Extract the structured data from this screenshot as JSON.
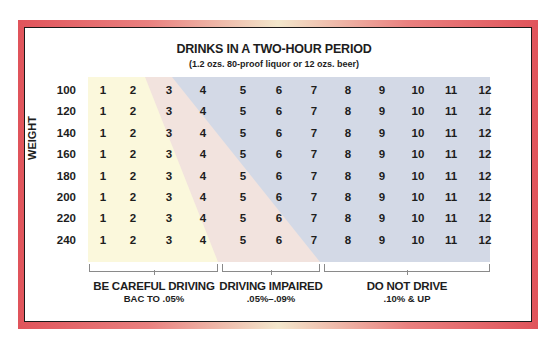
{
  "chart_data": {
    "type": "table",
    "title": "DRINKS IN A TWO-HOUR PERIOD",
    "subtitle": "(1.2 ozs. 80-proof liquor or 12 ozs. beer)",
    "ylabel": "WEIGHT",
    "row_labels": [
      "100",
      "120",
      "140",
      "160",
      "180",
      "200",
      "220",
      "240"
    ],
    "column_values": [
      "1",
      "2",
      "3",
      "4",
      "5",
      "6",
      "7",
      "8",
      "9",
      "10",
      "11",
      "12"
    ],
    "zones": [
      {
        "name": "BE CAREFUL DRIVING",
        "range": "BAC TO .05%",
        "color": "#fbf8dc"
      },
      {
        "name": "DRIVING IMPAIRED",
        "range": ".05%–.09%",
        "color": "#f2e3de"
      },
      {
        "name": "DO NOT DRIVE",
        "range": ".10% & UP",
        "color": "#d3d9e6"
      }
    ],
    "zone_boundaries_by_row": {
      "note": "drinks count where zone changes, top row 100 lbs to bottom row 240 lbs",
      "careful_to_impaired": [
        2.5,
        2.7,
        3.0,
        3.2,
        3.4,
        3.6,
        3.9,
        4.2
      ],
      "impaired_to_do_not_drive": [
        3.2,
        3.8,
        4.3,
        4.9,
        5.5,
        6.0,
        6.5,
        7.0
      ]
    }
  },
  "header": {
    "title": "DRINKS IN A TWO-HOUR PERIOD",
    "subtitle": "(1.2 ozs. 80-proof liquor or 12 ozs. beer)"
  },
  "axis": {
    "weight_label": "WEIGHT"
  },
  "rows": [
    {
      "weight": "100"
    },
    {
      "weight": "120"
    },
    {
      "weight": "140"
    },
    {
      "weight": "160"
    },
    {
      "weight": "180"
    },
    {
      "weight": "200"
    },
    {
      "weight": "220"
    },
    {
      "weight": "240"
    }
  ],
  "columns": [
    "1",
    "2",
    "3",
    "4",
    "5",
    "6",
    "7",
    "8",
    "9",
    "10",
    "11",
    "12"
  ],
  "legend": [
    {
      "title": "BE CAREFUL DRIVING",
      "sub": "BAC TO .05%"
    },
    {
      "title": "DRIVING IMPAIRED",
      "sub": ".05%–.09%"
    },
    {
      "title": "DO NOT DRIVE",
      "sub": ".10% & UP"
    }
  ]
}
